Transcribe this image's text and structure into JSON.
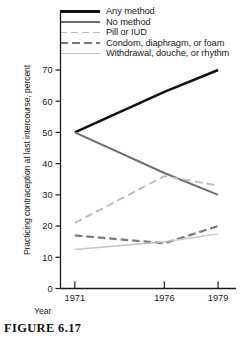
{
  "figure": {
    "caption": "FIGURE 6.17"
  },
  "chart_data": {
    "type": "line",
    "title": "",
    "xlabel": "Year",
    "ylabel": "Practicing contraception at last intercourse, percent",
    "x": [
      1971,
      1976,
      1979
    ],
    "xtick_labels": [
      "1971",
      "1976",
      "1979"
    ],
    "ytick_labels": [
      "0",
      "10",
      "20",
      "30",
      "40",
      "50",
      "60",
      "70"
    ],
    "yticks": [
      0,
      10,
      20,
      30,
      40,
      50,
      60,
      70
    ],
    "ylim": [
      0,
      75
    ],
    "xlim": [
      1970.2,
      1980.0
    ],
    "grid": false,
    "legend_position": "top-right",
    "series": [
      {
        "name": "Any method",
        "values": [
          50,
          63,
          70
        ],
        "color": "#111111",
        "style": "solid",
        "width": 2.6
      },
      {
        "name": "No method",
        "values": [
          50,
          37,
          30
        ],
        "color": "#6e6e6e",
        "style": "solid",
        "width": 2.0
      },
      {
        "name": "Pill or IUD",
        "values": [
          21,
          36,
          33
        ],
        "color": "#b9b9b9",
        "style": "long-dash",
        "width": 1.8
      },
      {
        "name": "Condom, diaphragm, or foam",
        "values": [
          17,
          14.5,
          20
        ],
        "color": "#7a7a7a",
        "style": "dash",
        "width": 2.3
      },
      {
        "name": "Withdrawal, douche, or rhythm",
        "values": [
          12.5,
          15,
          17.5
        ],
        "color": "#c2c2c2",
        "style": "solid",
        "width": 1.5
      }
    ]
  },
  "axes": {
    "ylabel": "Practicing contraception at last intercourse, percent",
    "xlabel": "Year"
  },
  "legend": {
    "items": [
      {
        "label": "Any method"
      },
      {
        "label": "No method"
      },
      {
        "label": "Pill or IUD"
      },
      {
        "label": "Condom, diaphragm, or foam"
      },
      {
        "label": "Withdrawal, douche, or rhythm"
      }
    ]
  }
}
